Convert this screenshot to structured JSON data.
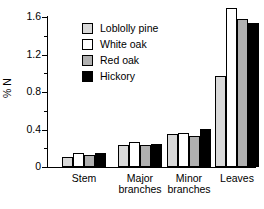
{
  "chart_data": {
    "type": "bar",
    "title": "",
    "xlabel": "",
    "ylabel": "% N",
    "ylim": [
      0,
      1.8
    ],
    "yticks": [
      0,
      0.4,
      0.8,
      1.2,
      1.6
    ],
    "ytick_labels": [
      "0",
      "0.4",
      "0.8",
      "1.2",
      "1.6"
    ],
    "minor_ticks": [
      0.2,
      0.6,
      1.0,
      1.4
    ],
    "grid": false,
    "legend_position": "upper-left-inside",
    "categories": [
      "Stem",
      "Major\nbranches",
      "Minor\nbranches",
      "Leaves"
    ],
    "category_labels": [
      "Stem",
      "Major branches",
      "Minor branches",
      "Leaves"
    ],
    "series": [
      {
        "name": "Loblolly pine",
        "color": "#d9d9d9",
        "values": [
          0.11,
          0.23,
          0.35,
          0.97
        ]
      },
      {
        "name": "White oak",
        "color": "#ffffff",
        "values": [
          0.15,
          0.27,
          0.36,
          1.7
        ]
      },
      {
        "name": "Red oak",
        "color": "#b0b0b0",
        "values": [
          0.13,
          0.23,
          0.33,
          1.58
        ]
      },
      {
        "name": "Hickory",
        "color": "#000000",
        "values": [
          0.15,
          0.25,
          0.41,
          1.54
        ]
      }
    ]
  },
  "legend": {
    "items": [
      {
        "label": "Loblolly pine",
        "color": "#d9d9d9"
      },
      {
        "label": "White oak",
        "color": "#ffffff"
      },
      {
        "label": "Red oak",
        "color": "#b0b0b0"
      },
      {
        "label": "Hickory",
        "color": "#000000"
      }
    ]
  },
  "axis": {
    "y_title": "% N",
    "y_labels": [
      "1.6",
      "1.2",
      "0.8",
      "0.4",
      "0"
    ],
    "x_labels": [
      "Stem",
      "Major\nbranches",
      "Minor\nbranches",
      "Leaves"
    ]
  }
}
